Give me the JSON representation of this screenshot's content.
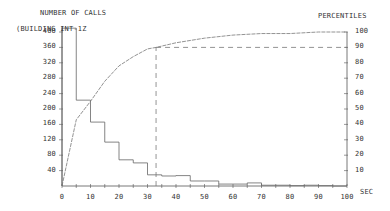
{
  "titles": {
    "left_axis_title": "NUMBER OF CALLS",
    "subtitle": "(BUILDING INT-1Z",
    "right_axis_title": "PERCENTILES",
    "x_unit": "SEC"
  },
  "left_ticks": [
    "40",
    "80",
    "120",
    "160",
    "200",
    "240",
    "280",
    "320",
    "360",
    "400"
  ],
  "right_ticks": [
    "10",
    "20",
    "30",
    "40",
    "50",
    "60",
    "70",
    "80",
    "90",
    "100"
  ],
  "x_ticks": [
    "0",
    "10",
    "20",
    "30",
    "40",
    "50",
    "60",
    "70",
    "80",
    "90",
    "100"
  ],
  "chart_data": {
    "type": "bar",
    "xlabel": "SEC",
    "ylabel": "NUMBER OF CALLS",
    "y2label": "PERCENTILES",
    "xlim": [
      0,
      100
    ],
    "ylim": [
      0,
      400
    ],
    "y2lim": [
      0,
      100
    ],
    "grid": false,
    "series": [
      {
        "name": "Number of calls (histogram, 5 sec bins)",
        "type": "step",
        "bin_edges": [
          0,
          5,
          10,
          15,
          20,
          25,
          30,
          35,
          40,
          45,
          50,
          55,
          60,
          65,
          70,
          75,
          80,
          85,
          90,
          95,
          100
        ],
        "values": [
          410,
          223,
          166,
          114,
          68,
          60,
          29,
          26,
          27,
          13,
          13,
          5,
          5,
          8,
          2,
          2,
          1,
          2,
          1,
          0
        ]
      },
      {
        "name": "Cumulative percentile",
        "type": "line",
        "axis": "right",
        "x": [
          0,
          5,
          10,
          15,
          20,
          25,
          30,
          33,
          40,
          50,
          60,
          70,
          80,
          90,
          100
        ],
        "values": [
          0,
          43,
          55,
          68,
          78,
          84,
          89,
          90,
          93,
          96,
          98,
          99,
          99,
          100,
          100
        ]
      }
    ],
    "annotations": [
      {
        "type": "dashed-line",
        "description": "90th percentile marker at ~33 sec",
        "x": 33,
        "percentile": 90
      }
    ]
  }
}
